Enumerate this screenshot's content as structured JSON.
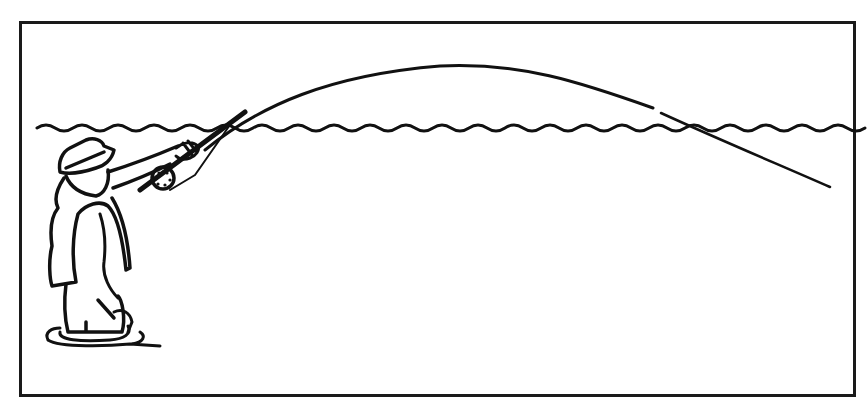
{
  "figure": {
    "elements": [
      "frame",
      "angler",
      "hat",
      "vest",
      "fly-rod",
      "reel",
      "fly-line",
      "water-surface",
      "ripples"
    ],
    "colors": {
      "ink": "#111111",
      "background": "#ffffff",
      "frame": "#1a1a1a"
    }
  }
}
